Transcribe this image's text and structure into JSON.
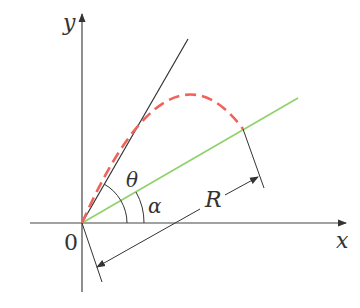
{
  "diagram": {
    "labels": {
      "x_axis": "x",
      "y_axis": "y",
      "origin": "0",
      "theta": "θ",
      "alpha": "α",
      "range": "R"
    },
    "colors": {
      "axes": "#333333",
      "launch_line": "#333333",
      "incline": "#8fd16a",
      "trajectory": "#f0625a",
      "dimension": "#333333"
    },
    "elements": [
      "x-axis with arrow",
      "y-axis with arrow",
      "launch direction line at angle θ+α",
      "inclined plane line at angle α (green)",
      "dashed parabolic trajectory (red)",
      "angle arc θ",
      "angle arc α",
      "range dimension R with arrows"
    ]
  }
}
